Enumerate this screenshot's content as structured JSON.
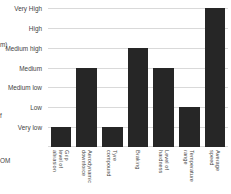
{
  "chart_data": {
    "type": "bar",
    "title": "",
    "subtitle": "",
    "xlabel": "",
    "ylabel": "",
    "grid": true,
    "legend": "none",
    "orientation": "vertical",
    "categories": [
      "Grip level of\nabrasion",
      "Aerodynamic\ndownforce",
      "Tyre\ncompound",
      "Braking",
      "Level of\nhardness",
      "Temperature\nrange",
      "Average\nspeed"
    ],
    "values": [
      1,
      4,
      1,
      5,
      4,
      2,
      7
    ],
    "value_labels": [
      "Very low",
      "Medium",
      "Very low",
      "Medium high",
      "Medium",
      "Low",
      "Very High"
    ],
    "ytick_labels": [
      "Very High",
      "High",
      "Medium high",
      "Medium",
      "Medium low",
      "Low",
      "Very low"
    ],
    "yscale": "ordinal",
    "ylim": [
      0,
      7
    ],
    "bar_color": "#262626",
    "grid_color": "#d9d9d9",
    "background_color": "#ffffff",
    "text_color": "#3f3f3f"
  },
  "edge_fragments": {
    "upper": "m)",
    "middle": "f",
    "lower": "OM"
  }
}
